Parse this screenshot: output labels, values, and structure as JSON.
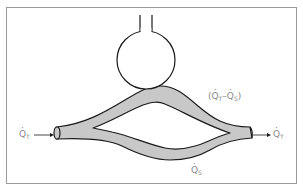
{
  "diagram": {
    "colors": {
      "frame": "#9a9a9a",
      "stroke": "#1a1a1a",
      "vessel_fill": "#c8c8c8",
      "label": "#8a8a8a",
      "background": "#ffffff"
    },
    "labels": {
      "inflow": {
        "symbol": "Q",
        "sub": "T"
      },
      "outflow": {
        "symbol": "Q",
        "sub": "T"
      },
      "upper_branch": {
        "open": "(",
        "a_symbol": "Q",
        "a_sub": "T",
        "minus": "–",
        "b_symbol": "Q",
        "b_sub": "S",
        "close": ")"
      },
      "lower_branch": {
        "symbol": "Q",
        "sub": "S"
      }
    },
    "components": [
      "alveolus",
      "airway",
      "upper-capillary-branch",
      "lower-shunt-branch",
      "inflow-arrow",
      "outflow-arrow"
    ]
  }
}
